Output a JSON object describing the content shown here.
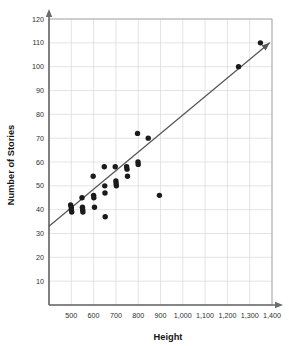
{
  "chart_data": {
    "type": "scatter",
    "title": "",
    "xlabel": "Height",
    "ylabel": "Number of Stories",
    "xlim": [
      400,
      1400
    ],
    "ylim": [
      0,
      120
    ],
    "grid": true,
    "legend": "none",
    "xticks": [
      500,
      600,
      700,
      800,
      900,
      1000,
      1100,
      1200,
      1300,
      1400
    ],
    "xticklabels": [
      "500",
      "600",
      "700",
      "800",
      "900",
      "1,000",
      "1,100",
      "1,200",
      "1,300",
      "1,400"
    ],
    "yticks": [
      10,
      20,
      30,
      40,
      50,
      60,
      70,
      80,
      90,
      100,
      110,
      120
    ],
    "yticklabels": [
      "10",
      "20",
      "30",
      "40",
      "50",
      "60",
      "70",
      "80",
      "90",
      "100",
      "110",
      "120"
    ],
    "series": [
      {
        "name": "buildings",
        "marker": "filled-circle",
        "color": "#1b1b1b",
        "points": [
          [
            497,
            42
          ],
          [
            500,
            41
          ],
          [
            500,
            40
          ],
          [
            502,
            39
          ],
          [
            548,
            45
          ],
          [
            550,
            41
          ],
          [
            551,
            40
          ],
          [
            552,
            39
          ],
          [
            598,
            54
          ],
          [
            600,
            46
          ],
          [
            601,
            45
          ],
          [
            604,
            41
          ],
          [
            648,
            58
          ],
          [
            650,
            50
          ],
          [
            651,
            47
          ],
          [
            652,
            37
          ],
          [
            697,
            58
          ],
          [
            700,
            52
          ],
          [
            701,
            51
          ],
          [
            702,
            50
          ],
          [
            748,
            58
          ],
          [
            750,
            57
          ],
          [
            752,
            54
          ],
          [
            797,
            72
          ],
          [
            799,
            60
          ],
          [
            800,
            59
          ],
          [
            845,
            70
          ],
          [
            895,
            46
          ],
          [
            1250,
            100
          ],
          [
            1348,
            110
          ]
        ]
      }
    ],
    "trendline": {
      "type": "line-of-best-fit",
      "x_start": 400,
      "y_start": 33,
      "x_end": 1390,
      "y_end": 110,
      "arrow": true,
      "color": "#58585a"
    }
  },
  "axes": {
    "x_title": "Height",
    "y_title": "Number of Stories"
  }
}
